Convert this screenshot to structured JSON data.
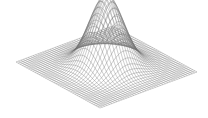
{
  "chart_data": {
    "type": "surface",
    "title": "",
    "xlabel": "",
    "ylabel": "",
    "zlabel": "",
    "function": "z = exp(-(x^2 + y^2) / (2*sigma^2))",
    "sigma": 0.55,
    "x_range": [
      -2,
      2
    ],
    "y_range": [
      -2,
      2
    ],
    "z_range": [
      0,
      1
    ],
    "grid_lines": 40,
    "axes_visible": false,
    "grid": false,
    "legend": null,
    "peak": {
      "x": 0,
      "y": 0,
      "z": 1
    }
  },
  "style": {
    "line_color": "#6e6e6e",
    "background": "#ffffff"
  },
  "projection": {
    "left_corner": [
      16,
      62
    ],
    "right_corner": [
      197,
      72
    ],
    "front_corner": [
      100,
      108
    ],
    "back_corner": [
      113,
      26
    ],
    "z_height_px": 72
  }
}
